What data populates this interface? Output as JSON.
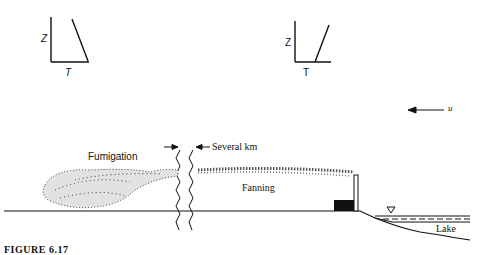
{
  "diagram": {
    "type": "atmospheric-plume-behavior",
    "profiles": [
      {
        "id": "left",
        "y_axis_label": "Z",
        "x_axis_label": "T",
        "lapse": "inversion-aloft-unstable-below"
      },
      {
        "id": "right",
        "y_axis_label": "Z",
        "x_axis_label": "T",
        "lapse": "stable"
      }
    ],
    "wind": {
      "label": "u",
      "direction": "left"
    },
    "labels": {
      "fumigation": "Fumigation",
      "fanning": "Fanning",
      "distance": "Several km",
      "lake": "Lake"
    },
    "caption": "FIGURE 6.17"
  }
}
